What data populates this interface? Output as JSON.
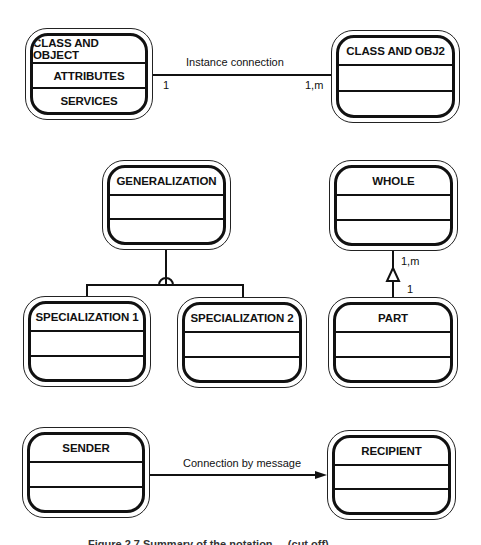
{
  "diagram": {
    "type": "object-oriented class diagram notation",
    "classes": {
      "class_and_object": {
        "name": "CLASS AND OBJECT",
        "attributes": "ATTRIBUTES",
        "services": "SERVICES"
      },
      "class_and_obj2": {
        "name": "CLASS AND OBJ2",
        "attributes": "",
        "services": ""
      },
      "generalization": {
        "name": "GENERALIZATION",
        "attributes": "",
        "services": ""
      },
      "specialization_1": {
        "name": "SPECIALIZATION 1",
        "attributes": "",
        "services": ""
      },
      "specialization_2": {
        "name": "SPECIALIZATION 2",
        "attributes": "",
        "services": ""
      },
      "whole": {
        "name": "WHOLE",
        "attributes": "",
        "services": ""
      },
      "part": {
        "name": "PART",
        "attributes": "",
        "services": ""
      },
      "sender": {
        "name": "SENDER",
        "attributes": "",
        "services": ""
      },
      "recipient": {
        "name": "RECIPIENT",
        "attributes": "",
        "services": ""
      }
    },
    "connections": {
      "instance": {
        "label": "Instance connection",
        "from": "CLASS AND OBJECT",
        "to": "CLASS AND OBJ2",
        "from_multiplicity": "1",
        "to_multiplicity": "1,m"
      },
      "gen_spec": {
        "label": "",
        "from": "GENERALIZATION",
        "to": [
          "SPECIALIZATION 1",
          "SPECIALIZATION 2"
        ]
      },
      "whole_part": {
        "label": "",
        "from": "PART",
        "to": "WHOLE",
        "whole_multiplicity": "1,m",
        "part_multiplicity": "1"
      },
      "message": {
        "label": "Connection by message",
        "from": "SENDER",
        "to": "RECIPIENT"
      }
    },
    "caption": "Figure 2.7 Summary of the notation ... (cut off)"
  }
}
